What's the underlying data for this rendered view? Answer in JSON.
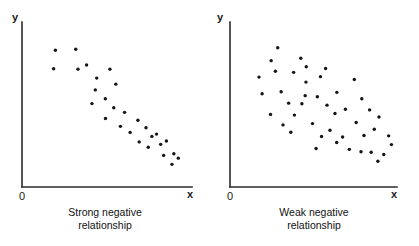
{
  "figure": {
    "background_color": "#ffffff",
    "point_color": "#141414",
    "axis_color": "#2b2b2b",
    "point_radius": 1.7
  },
  "panels": [
    {
      "id": "strong-negative",
      "axis": {
        "y_label": "y",
        "x_label": "x",
        "origin_label": "0",
        "origin_px": {
          "x": 22,
          "y": 187
        },
        "y_top_px": 22,
        "x_right_px": 192
      },
      "caption_line1": "Strong negative",
      "caption_line2": "relationship"
    },
    {
      "id": "weak-negative",
      "axis": {
        "y_label": "y",
        "x_label": "x",
        "origin_label": "0",
        "origin_px": {
          "x": 21,
          "y": 187
        },
        "y_top_px": 22,
        "x_right_px": 188
      },
      "caption_line1": "Weak negative",
      "caption_line2": "relationship"
    }
  ],
  "chart_data": [
    {
      "type": "scatter",
      "title": "Strong negative relationship",
      "xlabel": "x",
      "ylabel": "y",
      "origin_label": "0",
      "grid": false,
      "legend": "none",
      "axis_ticks": [],
      "xlim": [
        0,
        100
      ],
      "ylim": [
        0,
        100
      ],
      "n_points": 28,
      "description": "Points fall tightly along a downward-sloping band from upper-left to lower-right.",
      "points": [
        {
          "x": 16.6,
          "y": 86.6
        },
        {
          "x": 15.5,
          "y": 73.8
        },
        {
          "x": 29.4,
          "y": 87.3
        },
        {
          "x": 30.8,
          "y": 73.5
        },
        {
          "x": 36.2,
          "y": 76.4
        },
        {
          "x": 42.6,
          "y": 67.3
        },
        {
          "x": 50.9,
          "y": 73.5
        },
        {
          "x": 41.7,
          "y": 59.1
        },
        {
          "x": 54.6,
          "y": 63.1
        },
        {
          "x": 48.0,
          "y": 53.0
        },
        {
          "x": 39.6,
          "y": 49.6
        },
        {
          "x": 53.3,
          "y": 46.7
        },
        {
          "x": 48.1,
          "y": 39.2
        },
        {
          "x": 60.1,
          "y": 43.5
        },
        {
          "x": 57.5,
          "y": 33.8
        },
        {
          "x": 68.5,
          "y": 38.0
        },
        {
          "x": 63.6,
          "y": 29.6
        },
        {
          "x": 73.6,
          "y": 32.8
        },
        {
          "x": 69.3,
          "y": 23.0
        },
        {
          "x": 77.3,
          "y": 26.8
        },
        {
          "x": 80.2,
          "y": 28.4
        },
        {
          "x": 75.0,
          "y": 19.3
        },
        {
          "x": 82.8,
          "y": 21.3
        },
        {
          "x": 86.4,
          "y": 23.6
        },
        {
          "x": 84.7,
          "y": 13.6
        },
        {
          "x": 91.1,
          "y": 14.8
        },
        {
          "x": 93.9,
          "y": 11.7
        },
        {
          "x": 89.9,
          "y": 7.4
        }
      ]
    },
    {
      "type": "scatter",
      "title": "Weak negative relationship",
      "xlabel": "x",
      "ylabel": "y",
      "origin_label": "0",
      "grid": false,
      "legend": "none",
      "axis_ticks": [],
      "xlim": [
        0,
        100
      ],
      "ylim": [
        0,
        100
      ],
      "n_points": 44,
      "description": "Points scatter widely with only a loose downward drift from upper-left to lower-right.",
      "points": [
        {
          "x": 26.1,
          "y": 88.4
        },
        {
          "x": 40.9,
          "y": 81.1
        },
        {
          "x": 21.9,
          "y": 79.4
        },
        {
          "x": 36.3,
          "y": 71.3
        },
        {
          "x": 44.4,
          "y": 75.2
        },
        {
          "x": 56.8,
          "y": 74.0
        },
        {
          "x": 14.1,
          "y": 68.0
        },
        {
          "x": 24.6,
          "y": 72.1
        },
        {
          "x": 44.2,
          "y": 64.5
        },
        {
          "x": 53.5,
          "y": 68.3
        },
        {
          "x": 75.2,
          "y": 66.3
        },
        {
          "x": 16.1,
          "y": 56.4
        },
        {
          "x": 28.3,
          "y": 57.8
        },
        {
          "x": 43.7,
          "y": 55.1
        },
        {
          "x": 51.5,
          "y": 54.3
        },
        {
          "x": 64.0,
          "y": 57.4
        },
        {
          "x": 80.0,
          "y": 53.0
        },
        {
          "x": 33.1,
          "y": 49.9
        },
        {
          "x": 41.6,
          "y": 49.5
        },
        {
          "x": 57.7,
          "y": 48.5
        },
        {
          "x": 69.5,
          "y": 45.7
        },
        {
          "x": 85.0,
          "y": 45.2
        },
        {
          "x": 21.5,
          "y": 42.1
        },
        {
          "x": 36.8,
          "y": 41.6
        },
        {
          "x": 62.8,
          "y": 42.7
        },
        {
          "x": 91.0,
          "y": 40.3
        },
        {
          "x": 29.5,
          "y": 34.8
        },
        {
          "x": 48.4,
          "y": 35.7
        },
        {
          "x": 76.4,
          "y": 36.5
        },
        {
          "x": 34.5,
          "y": 29.7
        },
        {
          "x": 59.6,
          "y": 31.1
        },
        {
          "x": 88.0,
          "y": 31.8
        },
        {
          "x": 54.2,
          "y": 26.7
        },
        {
          "x": 67.7,
          "y": 26.4
        },
        {
          "x": 81.4,
          "y": 27.4
        },
        {
          "x": 97.2,
          "y": 27.2
        },
        {
          "x": 63.9,
          "y": 22.6
        },
        {
          "x": 99.0,
          "y": 21.1
        },
        {
          "x": 50.7,
          "y": 18.4
        },
        {
          "x": 72.0,
          "y": 17.8
        },
        {
          "x": 79.5,
          "y": 16.1
        },
        {
          "x": 86.0,
          "y": 15.8
        },
        {
          "x": 94.1,
          "y": 14.2
        },
        {
          "x": 90.3,
          "y": 9.6
        }
      ]
    }
  ]
}
